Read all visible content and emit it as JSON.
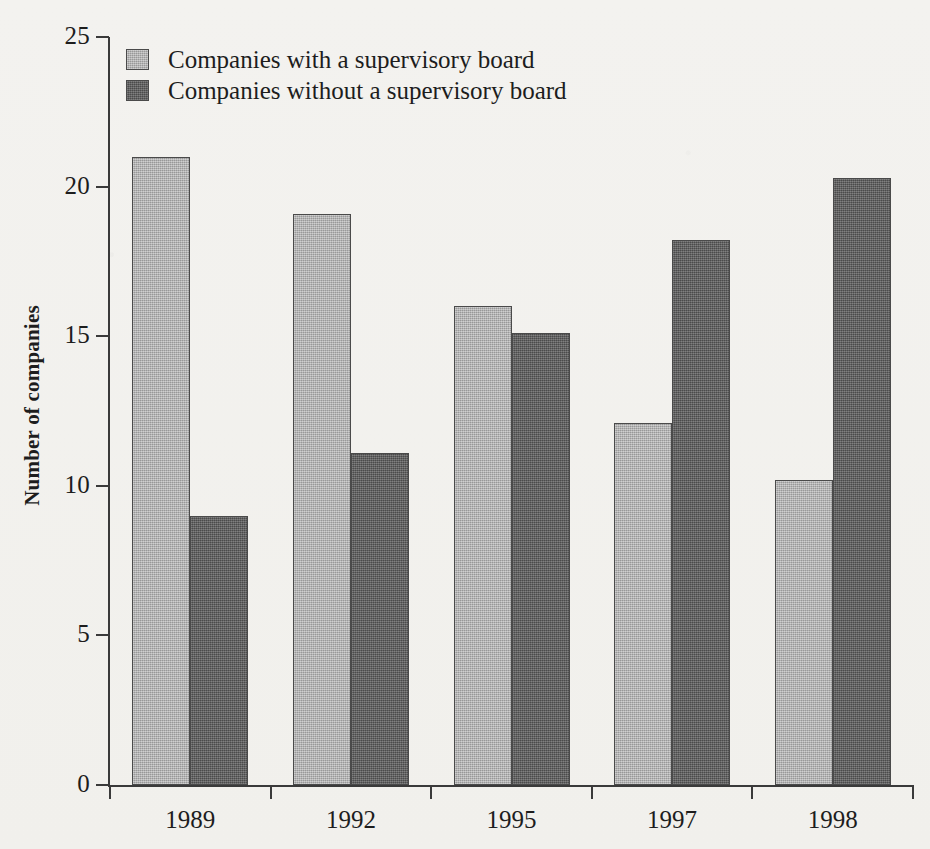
{
  "chart_data": {
    "type": "bar",
    "title": "",
    "xlabel": "",
    "ylabel": "Number of companies",
    "categories": [
      "1989",
      "1992",
      "1995",
      "1997",
      "1998"
    ],
    "series": [
      {
        "name": "Companies with a supervisory board",
        "color": "#a9a9a9",
        "values": [
          21.0,
          19.1,
          16.0,
          12.1,
          10.2
        ]
      },
      {
        "name": "Companies without a supervisory board",
        "color": "#5c5c5c",
        "values": [
          9.0,
          11.1,
          15.1,
          18.2,
          20.3
        ]
      }
    ],
    "ylim": [
      0,
      25
    ],
    "yticks": [
      "0",
      "5",
      "10",
      "15",
      "20",
      "25"
    ],
    "grid": false,
    "legend_position": "top-left"
  },
  "legend": {
    "items": [
      {
        "label": "Companies with a supervisory board",
        "swatch": "light-gray-square"
      },
      {
        "label": "Companies without a supervisory board",
        "swatch": "dark-gray-square"
      }
    ]
  },
  "axes": {
    "y_title": "Number of companies",
    "y_ticks": [
      "25",
      "20",
      "15",
      "10",
      "5",
      "0"
    ],
    "x_ticks": [
      "1989",
      "1992",
      "1995",
      "1997",
      "1998"
    ]
  }
}
